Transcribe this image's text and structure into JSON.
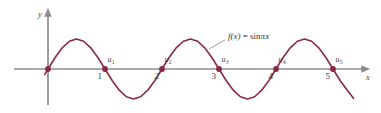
{
  "figure": {
    "background_color": "#ffffff",
    "width": 381,
    "height": 113
  },
  "axes": {
    "x_axis_label": "x",
    "y_axis_label": "y",
    "axis_color": "#8c8c8c",
    "origin_px": {
      "x": 48,
      "y": 69
    },
    "unit_px": 57,
    "x_tick_labels": [
      "1",
      "2",
      "3",
      "4",
      "5"
    ],
    "x_tick_values": [
      1,
      2,
      3,
      4,
      5
    ],
    "y_tick_labels": []
  },
  "curve": {
    "color": "#8b2942",
    "stroke_width": 1.6,
    "amplitude_px": 30,
    "x_start": -0.06,
    "x_end": 5.36
  },
  "annotation": {
    "text_plain": "f(x) = sin πx",
    "fn_name": "f",
    "fn_arg": "(x)",
    "equals": " = sin",
    "greek_pi": "π",
    "pi_arg": "x",
    "leader_from": {
      "x": 225,
      "y": 40
    },
    "leader_to": {
      "x": 209,
      "y": 49
    }
  },
  "roots": [
    {
      "label": "u",
      "subscript": "",
      "x_value": 0,
      "px_x": 48,
      "show_label": false,
      "show_tick": false
    },
    {
      "label": "u",
      "subscript": "1",
      "x_value": 1,
      "px_x": 105,
      "show_label": true,
      "show_tick": true
    },
    {
      "label": "u",
      "subscript": "2",
      "x_value": 2,
      "px_x": 162,
      "show_label": true,
      "show_tick": true
    },
    {
      "label": "u",
      "subscript": "3",
      "x_value": 3,
      "px_x": 219,
      "show_label": true,
      "show_tick": true
    },
    {
      "label": "u",
      "subscript": "4",
      "x_value": 4,
      "px_x": 276,
      "show_label": true,
      "show_tick": true
    },
    {
      "label": "u",
      "subscript": "5",
      "x_value": 5,
      "px_x": 333,
      "show_label": true,
      "show_tick": true
    }
  ],
  "chart_data": {
    "type": "line",
    "title": "",
    "subtitle": "",
    "xlabel": "x",
    "ylabel": "y",
    "xlim": [
      -0.1,
      5.4
    ],
    "ylim": [
      -1.15,
      1.15
    ],
    "grid": false,
    "legend": null,
    "function_expression": "f(x) = sin(πx)",
    "x_ticks": [
      1,
      2,
      3,
      4,
      5
    ],
    "y_ticks": [],
    "marked_points": {
      "name": "roots of f",
      "labels": [
        "",
        "u₁",
        "u₂",
        "u₃",
        "u₄",
        "u₅"
      ],
      "x": [
        0,
        1,
        2,
        3,
        4,
        5
      ],
      "y": [
        0,
        0,
        0,
        0,
        0,
        0
      ]
    },
    "series": [
      {
        "name": "f(x) = sin πx",
        "color": "#8b2942",
        "x": [
          -0.06,
          0,
          0.125,
          0.25,
          0.375,
          0.5,
          0.625,
          0.75,
          0.875,
          1,
          1.125,
          1.25,
          1.375,
          1.5,
          1.625,
          1.75,
          1.875,
          2,
          2.125,
          2.25,
          2.375,
          2.5,
          2.625,
          2.75,
          2.875,
          3,
          3.125,
          3.25,
          3.375,
          3.5,
          3.625,
          3.75,
          3.875,
          4,
          4.125,
          4.25,
          4.375,
          4.5,
          4.625,
          4.75,
          4.875,
          5,
          5.125,
          5.25,
          5.36
        ],
        "y": [
          -0.188,
          0,
          0.383,
          0.707,
          0.924,
          1,
          0.924,
          0.707,
          0.383,
          0,
          -0.383,
          -0.707,
          -0.924,
          -1,
          -0.924,
          -0.707,
          -0.383,
          0,
          0.383,
          0.707,
          0.924,
          1,
          0.924,
          0.707,
          0.383,
          0,
          -0.383,
          -0.707,
          -0.924,
          -1,
          -0.924,
          -0.707,
          -0.383,
          0,
          0.383,
          0.707,
          0.924,
          1,
          0.924,
          0.707,
          0.383,
          0,
          -0.383,
          -0.707,
          -0.976
        ]
      }
    ]
  }
}
